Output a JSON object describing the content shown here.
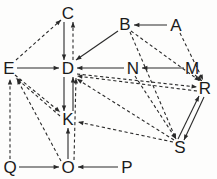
{
  "figure": {
    "kind": "directed-graph",
    "width": 217,
    "height": 179,
    "background_color": "#fdfdfc",
    "ink_color": "#2a2a2a",
    "label_color": "#1b1b1b"
  },
  "nodes": [
    {
      "id": "C",
      "label": "C",
      "x": 68,
      "y": 13
    },
    {
      "id": "B",
      "label": "B",
      "x": 125,
      "y": 24
    },
    {
      "id": "A",
      "label": "A",
      "x": 176,
      "y": 25
    },
    {
      "id": "E",
      "label": "E",
      "x": 9,
      "y": 68
    },
    {
      "id": "D",
      "label": "D",
      "x": 68,
      "y": 68
    },
    {
      "id": "N",
      "label": "N",
      "x": 133,
      "y": 68
    },
    {
      "id": "M",
      "label": "M",
      "x": 192,
      "y": 68
    },
    {
      "id": "R",
      "label": "R",
      "x": 205,
      "y": 88
    },
    {
      "id": "K",
      "label": "K",
      "x": 68,
      "y": 119
    },
    {
      "id": "S",
      "label": "S",
      "x": 180,
      "y": 147
    },
    {
      "id": "Q",
      "label": "Q",
      "x": 10,
      "y": 167
    },
    {
      "id": "O",
      "label": "O",
      "x": 68,
      "y": 167
    },
    {
      "id": "P",
      "label": "P",
      "x": 127,
      "y": 167
    }
  ],
  "edges": [
    {
      "from": "E",
      "to": "C",
      "style": "dashed",
      "x1": 16,
      "y1": 60,
      "x2": 61,
      "y2": 20
    },
    {
      "from": "C",
      "to": "D",
      "style": "solid",
      "x1": 64,
      "y1": 22,
      "x2": 64,
      "y2": 60
    },
    {
      "from": "D",
      "to": "C",
      "style": "dashed",
      "x1": 73,
      "y1": 60,
      "x2": 73,
      "y2": 22
    },
    {
      "from": "A",
      "to": "B",
      "style": "solid",
      "x1": 167,
      "y1": 25,
      "x2": 134,
      "y2": 25
    },
    {
      "from": "A",
      "to": "R",
      "style": "dashed",
      "x1": 180,
      "y1": 33,
      "x2": 203,
      "y2": 80
    },
    {
      "from": "B",
      "to": "D",
      "style": "solid",
      "x1": 118,
      "y1": 31,
      "x2": 76,
      "y2": 60
    },
    {
      "from": "B",
      "to": "R",
      "style": "dashed",
      "x1": 131,
      "y1": 31,
      "x2": 200,
      "y2": 81
    },
    {
      "from": "B",
      "to": "S",
      "style": "dashed",
      "x1": 130,
      "y1": 32,
      "x2": 176,
      "y2": 139
    },
    {
      "from": "E",
      "to": "D",
      "style": "solid",
      "x1": 17,
      "y1": 68,
      "x2": 59,
      "y2": 68
    },
    {
      "from": "M",
      "to": "N",
      "style": "solid",
      "x1": 184,
      "y1": 68,
      "x2": 142,
      "y2": 68
    },
    {
      "from": "N",
      "to": "D",
      "style": "solid",
      "x1": 124,
      "y1": 68,
      "x2": 77,
      "y2": 68
    },
    {
      "from": "M",
      "to": "R",
      "style": "dashed",
      "x1": 195,
      "y1": 75,
      "x2": 202,
      "y2": 81
    },
    {
      "from": "D",
      "to": "K",
      "style": "solid",
      "x1": 64,
      "y1": 77,
      "x2": 64,
      "y2": 111
    },
    {
      "from": "K",
      "to": "D",
      "style": "solid",
      "x1": 73,
      "y1": 111,
      "x2": 73,
      "y2": 77
    },
    {
      "from": "E",
      "to": "K",
      "style": "dashed",
      "x1": 15,
      "y1": 75,
      "x2": 60,
      "y2": 112
    },
    {
      "from": "K",
      "to": "E",
      "style": "dashed",
      "x1": 60,
      "y1": 116,
      "x2": 16,
      "y2": 78
    },
    {
      "from": "D",
      "to": "R",
      "style": "dashed",
      "x1": 77,
      "y1": 74,
      "x2": 197,
      "y2": 87
    },
    {
      "from": "R",
      "to": "D",
      "style": "dashed",
      "x1": 197,
      "y1": 91,
      "x2": 77,
      "y2": 76
    },
    {
      "from": "S",
      "to": "D",
      "style": "dashed",
      "x1": 174,
      "y1": 140,
      "x2": 77,
      "y2": 79
    },
    {
      "from": "N",
      "to": "S",
      "style": "dashed",
      "x1": 135,
      "y1": 76,
      "x2": 176,
      "y2": 139
    },
    {
      "from": "S",
      "to": "R",
      "style": "solid",
      "x1": 178,
      "y1": 139,
      "x2": 199,
      "y2": 96
    },
    {
      "from": "R",
      "to": "S",
      "style": "solid",
      "x1": 204,
      "y1": 97,
      "x2": 184,
      "y2": 140
    },
    {
      "from": "O",
      "to": "K",
      "style": "solid",
      "x1": 68,
      "y1": 159,
      "x2": 68,
      "y2": 128
    },
    {
      "from": "O",
      "to": "D",
      "style": "dashed",
      "x1": 74,
      "y1": 160,
      "x2": 76,
      "y2": 78
    },
    {
      "from": "O",
      "to": "E",
      "style": "dashed",
      "x1": 61,
      "y1": 161,
      "x2": 17,
      "y2": 79
    },
    {
      "from": "Q",
      "to": "O",
      "style": "solid",
      "x1": 19,
      "y1": 167,
      "x2": 59,
      "y2": 167
    },
    {
      "from": "P",
      "to": "O",
      "style": "solid",
      "x1": 118,
      "y1": 167,
      "x2": 78,
      "y2": 167
    },
    {
      "from": "Q",
      "to": "E",
      "style": "dashed",
      "x1": 10,
      "y1": 159,
      "x2": 10,
      "y2": 79
    },
    {
      "from": "S",
      "to": "K",
      "style": "dashed",
      "x1": 173,
      "y1": 142,
      "x2": 78,
      "y2": 122
    }
  ],
  "legend": {
    "solid_edge_meaning": "solid arrow",
    "dashed_edge_meaning": "dashed arrow"
  }
}
